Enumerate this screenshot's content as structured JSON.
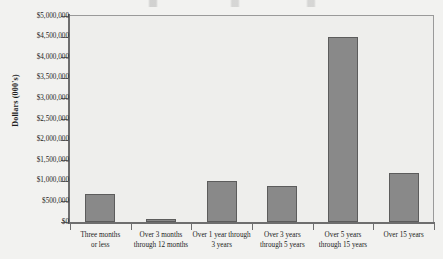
{
  "chart_data": {
    "type": "bar",
    "title": "",
    "xlabel": "",
    "ylabel": "Dollars (000's)",
    "categories": [
      "Three months or less",
      "Over 3 months through 12 months",
      "Over 1 year through 3 years",
      "Over 3 years through 5 years",
      "Over 5 years through 15 years",
      "Over 15 years"
    ],
    "category_lines": [
      [
        "Three months",
        "or less"
      ],
      [
        "Over 3 months",
        "through 12 months"
      ],
      [
        "Over 1 year through",
        "3 years"
      ],
      [
        "Over 3 years",
        "through 5 years"
      ],
      [
        "Over 5 years",
        "through 15 years"
      ],
      [
        "Over 15 years"
      ]
    ],
    "values": [
      680000,
      80000,
      1000000,
      880000,
      4500000,
      1200000
    ],
    "ylim": [
      0,
      5000000
    ],
    "ytick_values": [
      5000000,
      4500000,
      4000000,
      3500000,
      3000000,
      2500000,
      2000000,
      1500000,
      1000000,
      500000,
      0
    ],
    "ytick_labels": [
      "$5,000,000",
      "$4,500,000",
      "$4,000,000",
      "$3,500,000",
      "$3,000,000",
      "$2,500,000",
      "$2,000,000",
      "$1,500,000",
      "$1,000,000",
      "$500,000",
      "$0"
    ],
    "grid": false,
    "legend": null,
    "colors": {
      "bar_fill": "#898989",
      "bar_border": "#5c5c5c",
      "plot_background": "#eeeeec",
      "axis": "#6e6e6e",
      "text": "#1c1c1c"
    }
  }
}
